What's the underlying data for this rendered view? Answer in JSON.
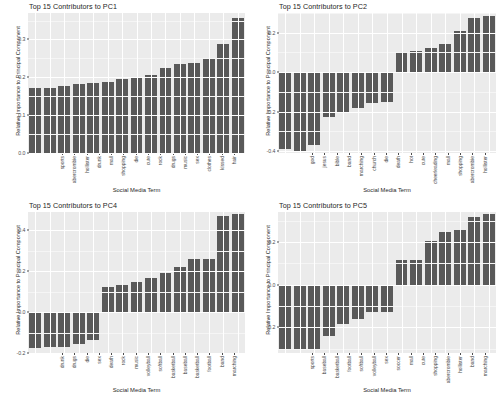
{
  "figure": {
    "layout": "2x2 facet grid of bar charts",
    "panel_background": "#ebebeb",
    "bar_color": "#595959",
    "gridline_color": "#ffffff",
    "page_background": "#ffffff"
  },
  "chart_data": [
    {
      "type": "bar",
      "title": "Top 15 Contributors to PC1",
      "xlabel": "Social Media Term",
      "ylabel": "Relative Importance to Principal Component",
      "categories": [
        "sports",
        "abercrombie",
        "hollister",
        "drunk",
        "mall",
        "shopping",
        "die",
        "cute",
        "rock",
        "drugs",
        "music",
        "sex",
        "clothes",
        "kissed",
        "hair"
      ],
      "values": [
        0.171,
        0.172,
        0.177,
        0.182,
        0.184,
        0.187,
        0.196,
        0.199,
        0.207,
        0.225,
        0.234,
        0.238,
        0.252,
        0.288,
        0.356
      ],
      "ylim": [
        0.0,
        0.37
      ],
      "yticks": [
        0.0,
        0.1,
        0.2,
        0.3
      ],
      "yticklabels": [
        "0.0",
        "0.1",
        "0.2",
        "0.3"
      ],
      "grid": true,
      "legend": "none"
    },
    {
      "type": "bar",
      "title": "Top 15 Contributors to PC2",
      "xlabel": "Social Media Term",
      "ylabel": "Relative Importance to Principal Component",
      "categories": [
        "god",
        "jesus",
        "bible",
        "band",
        "marching",
        "church",
        "die",
        "death",
        "hot",
        "cute",
        "cheerleading",
        "mall",
        "shopping",
        "abercrombie",
        "hollister"
      ],
      "values": [
        -0.392,
        -0.4,
        -0.369,
        -0.225,
        -0.206,
        -0.181,
        -0.154,
        -0.153,
        0.101,
        0.106,
        0.124,
        0.145,
        0.208,
        0.277,
        0.287
      ],
      "ylim": [
        -0.41,
        0.3
      ],
      "yticks": [
        0.2,
        0.0,
        -0.2,
        -0.4
      ],
      "yticklabels": [
        "0.2",
        "0.0",
        "-0.2",
        "-0.4"
      ],
      "grid": true,
      "legend": "none"
    },
    {
      "type": "bar",
      "title": "Top 15 Contributors to PC4",
      "xlabel": "Social Media Term",
      "ylabel": "Relative Importance to Principal Component",
      "categories": [
        "drunk",
        "drugs",
        "die",
        "sex",
        "death",
        "rock",
        "music",
        "volleyball",
        "softball",
        "basketball",
        "baseball",
        "basketball",
        "football",
        "band",
        "marching"
      ],
      "values": [
        -0.175,
        -0.172,
        -0.172,
        -0.157,
        -0.135,
        0.122,
        0.132,
        0.146,
        0.167,
        0.191,
        0.219,
        0.259,
        0.262,
        0.468,
        0.478
      ],
      "ylim": [
        -0.2,
        0.49
      ],
      "yticks": [
        0.4,
        0.2,
        0.0,
        -0.2
      ],
      "yticklabels": [
        "0.4",
        "0.2",
        "0.0",
        "-0.2"
      ],
      "grid": true,
      "legend": "none"
    },
    {
      "type": "bar",
      "title": "Top 15 Contributors to PC5",
      "xlabel": "Social Media Term",
      "ylabel": "Relative Importance to Principal Component",
      "categories": [
        "sports",
        "baseball",
        "basketball",
        "football",
        "softball",
        "volleyball",
        "sex",
        "soccer",
        "mall",
        "cute",
        "shopping",
        "abercrombie",
        "hollister",
        "band",
        "marching"
      ],
      "values": [
        -0.307,
        -0.3,
        -0.306,
        -0.239,
        -0.185,
        -0.159,
        -0.129,
        -0.129,
        0.113,
        0.116,
        0.205,
        0.247,
        0.254,
        0.315,
        0.33
      ],
      "ylim": [
        -0.32,
        0.34
      ],
      "yticks": [
        0.2,
        0.0,
        -0.2
      ],
      "yticklabels": [
        "0.2",
        "0.0",
        "-0.2"
      ],
      "grid": true,
      "legend": "none"
    }
  ]
}
